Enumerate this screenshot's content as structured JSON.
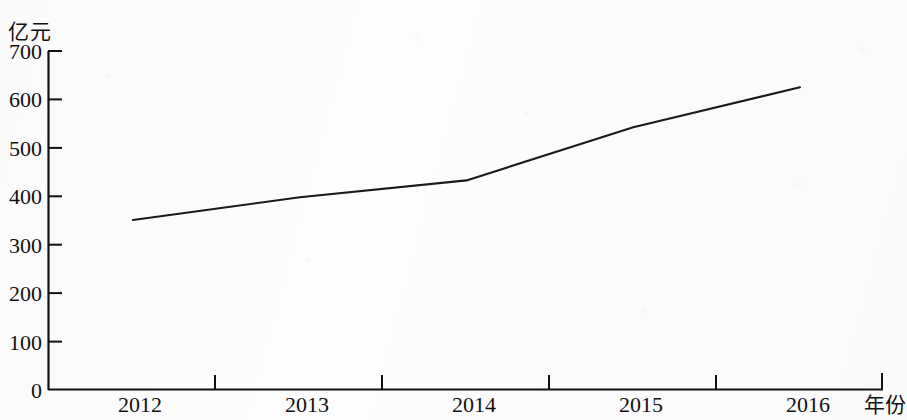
{
  "chart_data": {
    "type": "line",
    "title": "",
    "subtitle": "",
    "xlabel": "年份",
    "ylabel": "亿元",
    "categories": [
      "2012",
      "2013",
      "2014",
      "2015",
      "2016"
    ],
    "series": [
      {
        "name": "",
        "values": [
          350,
          397,
          432,
          542,
          625
        ]
      }
    ],
    "x_tick_labels": [
      "2012",
      "2013",
      "2014",
      "2015",
      "2016"
    ],
    "y_tick_labels": [
      "0",
      "100",
      "200",
      "300",
      "400",
      "500",
      "600",
      "700"
    ],
    "y_tick_values": [
      0,
      100,
      200,
      300,
      400,
      500,
      600,
      700
    ],
    "ylim": [
      0,
      700
    ],
    "grid": false,
    "legend": false,
    "legend_position": "none",
    "markers": false,
    "line_color": "#1a1a1a",
    "axis_color": "#111111",
    "background_color": "#fdfdfd",
    "annotations": []
  },
  "axes": {
    "y_unit_label": "亿元",
    "x_axis_name": "年份"
  }
}
